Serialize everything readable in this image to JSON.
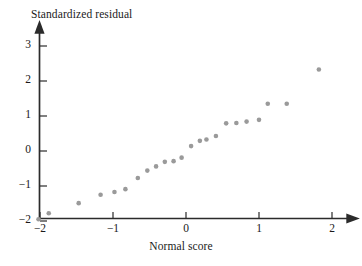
{
  "chart_data": {
    "type": "scatter",
    "title": "",
    "xlabel": "Normal score",
    "ylabel": "Standardized residual",
    "xlim": [
      -2.35,
      2.4
    ],
    "ylim": [
      -2.05,
      3.35
    ],
    "xticks": [
      -2,
      -1,
      0,
      1,
      2
    ],
    "xticklabels": [
      "−2",
      "−1",
      "0",
      "1",
      "2"
    ],
    "yticks": [
      -2,
      -1,
      0,
      1,
      2,
      3
    ],
    "yticklabels": [
      "−2",
      "−1",
      "0",
      "1",
      "2",
      "3"
    ],
    "grid": false,
    "legend": null,
    "marker": {
      "shape": "circle",
      "color": "#9a9a9a",
      "size": 4.6
    },
    "axis_style": {
      "color": "#2b2b2b",
      "arrow_heads": [
        "x-right",
        "y-top"
      ]
    },
    "points": [
      {
        "x": -2.02,
        "y": -1.95
      },
      {
        "x": -1.88,
        "y": -1.78
      },
      {
        "x": -1.47,
        "y": -1.49
      },
      {
        "x": -1.17,
        "y": -1.25
      },
      {
        "x": -0.98,
        "y": -1.17
      },
      {
        "x": -0.83,
        "y": -1.09
      },
      {
        "x": -0.66,
        "y": -0.77
      },
      {
        "x": -0.53,
        "y": -0.56
      },
      {
        "x": -0.41,
        "y": -0.44
      },
      {
        "x": -0.29,
        "y": -0.31
      },
      {
        "x": -0.17,
        "y": -0.29
      },
      {
        "x": -0.06,
        "y": -0.19
      },
      {
        "x": 0.07,
        "y": 0.14
      },
      {
        "x": 0.19,
        "y": 0.29
      },
      {
        "x": 0.28,
        "y": 0.33
      },
      {
        "x": 0.41,
        "y": 0.43
      },
      {
        "x": 0.55,
        "y": 0.79
      },
      {
        "x": 0.69,
        "y": 0.8
      },
      {
        "x": 0.83,
        "y": 0.84
      },
      {
        "x": 1.0,
        "y": 0.89
      },
      {
        "x": 1.12,
        "y": 1.35
      },
      {
        "x": 1.38,
        "y": 1.35
      },
      {
        "x": 1.82,
        "y": 2.33
      }
    ]
  }
}
